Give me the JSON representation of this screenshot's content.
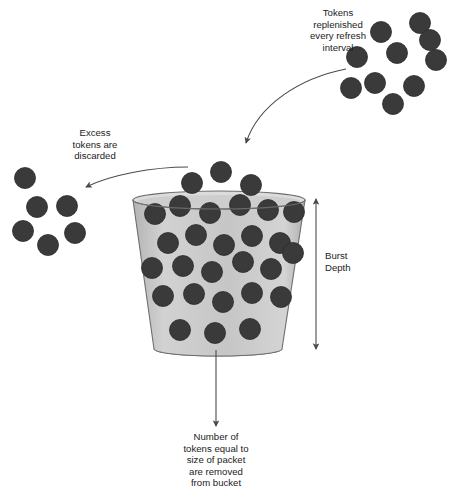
{
  "diagram": {
    "colors": {
      "token_fill": "#3a3a3a",
      "token_stroke": "#2b2b2b",
      "bucket_fill": "#c8c8c8",
      "bucket_stroke": "#6e6e6e",
      "bucket_base_fill": "#8d8d8d",
      "arrow_stroke": "#4a4a4a",
      "text": "#1c1c1c",
      "background": "#ffffff"
    },
    "labels": {
      "replenish": {
        "id": "tokens-replenished-label",
        "lines": [
          "Tokens",
          "replenished",
          "every refresh",
          "interval"
        ],
        "align": "center",
        "x": 338,
        "y": 16
      },
      "excess": {
        "id": "excess-tokens-label",
        "lines": [
          "Excess",
          "tokens are",
          "discarded"
        ],
        "align": "center",
        "x": 95,
        "y": 136
      },
      "burst_depth": {
        "id": "burst-depth-label",
        "lines": [
          "Burst",
          "Depth"
        ],
        "align": "start",
        "x": 325,
        "y": 259
      },
      "removed": {
        "id": "tokens-removed-label",
        "lines": [
          "Number of",
          "tokens equal to",
          "size of packet",
          "are removed",
          "from bucket"
        ],
        "align": "center",
        "x": 216,
        "y": 440
      }
    },
    "bucket": {
      "name": "token-bucket",
      "top_left_x": 133,
      "top_right_x": 305,
      "top_y": 200,
      "bottom_left_x": 154,
      "bottom_right_x": 282,
      "bottom_y": 349,
      "rim_ellipse_ry": 9,
      "base_ellipse_ry": 7
    },
    "arrows": {
      "replenish_arrow": {
        "name": "replenish-arrow",
        "path": "M 346 69 C 300 78 258 105 246 143",
        "arrowhead_at": [
          245,
          150
        ]
      },
      "discard_arrow": {
        "name": "discard-arrow",
        "path": "M 188 167 C 152 167 110 175 86 187",
        "arrowhead_at": [
          79,
          190
        ]
      },
      "burst_depth_arrow": {
        "name": "burst-depth-arrow",
        "x": 316,
        "y_top": 199,
        "y_bottom": 349,
        "double_headed": true
      },
      "removal_arrow": {
        "name": "packet-removal-arrow",
        "x": 216,
        "y_top": 350,
        "y_bottom": 426
      }
    },
    "token_radius": 10.5,
    "token_groups": {
      "incoming": {
        "name": "incoming-token-cluster",
        "count": 10,
        "centers": [
          [
            381,
            32
          ],
          [
            420,
            23
          ],
          [
            397,
            53
          ],
          [
            357,
            57
          ],
          [
            436,
            60
          ],
          [
            375,
            83
          ],
          [
            414,
            86
          ],
          [
            393,
            104
          ],
          [
            351,
            88
          ],
          [
            430,
            40
          ]
        ]
      },
      "discarded": {
        "name": "discarded-token-cluster",
        "count": 6,
        "centers": [
          [
            25,
            178
          ],
          [
            37,
            207
          ],
          [
            67,
            206
          ],
          [
            23,
            231
          ],
          [
            75,
            233
          ],
          [
            48,
            245
          ]
        ]
      },
      "overflow": {
        "name": "overflow-token-cluster",
        "count": 3,
        "centers": [
          [
            192,
            183
          ],
          [
            221,
            172
          ],
          [
            251,
            185
          ]
        ]
      },
      "in_bucket": {
        "name": "bucket-token-cluster",
        "count": 25,
        "centers": [
          [
            155,
            214
          ],
          [
            180,
            206
          ],
          [
            210,
            213
          ],
          [
            240,
            205
          ],
          [
            268,
            210
          ],
          [
            294,
            212
          ],
          [
            168,
            243
          ],
          [
            196,
            235
          ],
          [
            224,
            245
          ],
          [
            252,
            236
          ],
          [
            280,
            243
          ],
          [
            152,
            268
          ],
          [
            183,
            266
          ],
          [
            212,
            272
          ],
          [
            243,
            262
          ],
          [
            271,
            269
          ],
          [
            293,
            253
          ],
          [
            163,
            296
          ],
          [
            194,
            294
          ],
          [
            223,
            302
          ],
          [
            252,
            293
          ],
          [
            281,
            297
          ],
          [
            180,
            330
          ],
          [
            215,
            333
          ],
          [
            250,
            329
          ]
        ]
      }
    }
  }
}
